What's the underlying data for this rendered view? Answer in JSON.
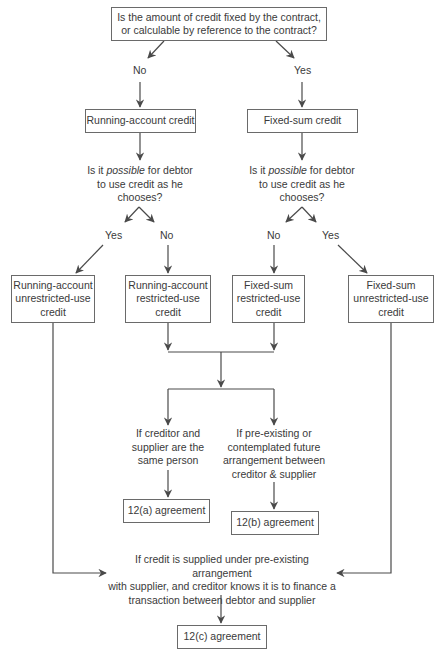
{
  "diagram": {
    "top_question": {
      "line1": "Is the amount of credit fixed by the contract,",
      "line2": "or calculable by reference to the contract?"
    },
    "branch_labels": {
      "top_no": "No",
      "top_yes": "Yes",
      "left_yes": "Yes",
      "left_no": "No",
      "right_no": "No",
      "right_yes": "Yes"
    },
    "level1": {
      "running_account": "Running-account credit",
      "fixed_sum": "Fixed-sum credit"
    },
    "question2": {
      "pre": "Is it ",
      "emph": "possible",
      "post": " for debtor",
      "line2": "to use credit as he",
      "line3": "chooses?"
    },
    "level2": [
      {
        "line1": "Running-account",
        "line2": "unrestricted-use",
        "line3": "credit"
      },
      {
        "line1": "Running-account",
        "line2": "restricted-use",
        "line3": "credit"
      },
      {
        "line1": "Fixed-sum",
        "line2": "restricted-use",
        "line3": "credit"
      },
      {
        "line1": "Fixed-sum",
        "line2": "unrestricted-use",
        "line3": "credit"
      }
    ],
    "condition_a": {
      "line1": "If creditor and",
      "line2": "supplier are the",
      "line3": "same person"
    },
    "condition_b": {
      "line1": "If pre-existing or",
      "line2": "contemplated future",
      "line3": "arrangement between",
      "line4": "creditor & supplier"
    },
    "condition_c": {
      "line1": "If credit is supplied under pre-existing arrangement",
      "line2": "with supplier, and creditor knows it is to finance a",
      "line3": "transaction between debtor and supplier"
    },
    "outcomes": {
      "a": "12(a) agreement",
      "b": "12(b) agreement",
      "c": "12(c) agreement"
    },
    "colors": {
      "line": "#4a4a4a",
      "box_border": "#6a6a6a",
      "text": "#3a3a3a",
      "background": "#ffffff"
    }
  }
}
